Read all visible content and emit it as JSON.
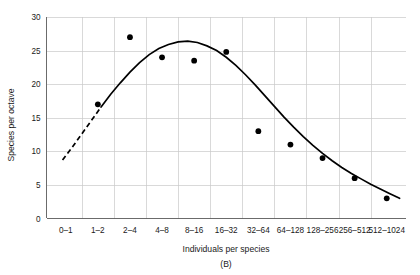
{
  "chart_data": {
    "type": "scatter",
    "title": "",
    "panel_label": "(B)",
    "xlabel": "Individuals per species",
    "ylabel": "Species per octave",
    "categories": [
      "0–1",
      "1–2",
      "2–4",
      "4–8",
      "8–16",
      "16–32",
      "32–64",
      "64–128",
      "128–256",
      "256–512",
      "512–1024"
    ],
    "values": [
      null,
      17,
      27,
      24,
      23.5,
      24.8,
      13,
      11,
      9,
      6,
      3
    ],
    "points": [
      {
        "category": "1–2",
        "x_index": 1,
        "y": 17
      },
      {
        "category": "2–4",
        "x_index": 2,
        "y": 27
      },
      {
        "category": "4–8",
        "x_index": 3,
        "y": 24
      },
      {
        "category": "8–16",
        "x_index": 4,
        "y": 23.5
      },
      {
        "category": "16–32",
        "x_index": 5,
        "y": 24.8
      },
      {
        "category": "32–64",
        "x_index": 6,
        "y": 13
      },
      {
        "category": "64–128",
        "x_index": 7,
        "y": 11
      },
      {
        "category": "128–256",
        "x_index": 8,
        "y": 9
      },
      {
        "category": "256–512",
        "x_index": 9,
        "y": 6
      },
      {
        "category": "512–1024",
        "x_index": 10,
        "y": 3
      }
    ],
    "fitted_curve": {
      "name": "lognormal fit",
      "style": "solid",
      "dashed_segment": "left extrapolation below veil line",
      "x_index": [
        -0.1,
        0.2,
        0.5,
        0.8,
        1.1,
        1.4,
        1.7,
        2.0,
        2.3,
        2.6,
        2.9,
        3.2,
        3.5,
        3.8,
        4.1,
        4.4,
        4.7,
        5.0,
        5.3,
        5.6,
        5.9,
        6.2,
        6.5,
        6.8,
        7.1,
        7.4,
        7.7,
        8.0,
        8.3,
        8.6,
        8.9,
        9.2,
        9.5,
        9.8,
        10.1,
        10.4
      ],
      "y": [
        8.7,
        10.6,
        12.6,
        14.6,
        16.6,
        18.5,
        20.2,
        21.8,
        23.2,
        24.4,
        25.3,
        25.9,
        26.3,
        26.4,
        26.2,
        25.7,
        25.0,
        24.0,
        22.8,
        21.4,
        19.9,
        18.3,
        16.7,
        15.1,
        13.6,
        12.2,
        10.9,
        9.7,
        8.6,
        7.6,
        6.7,
        5.9,
        5.1,
        4.4,
        3.7,
        3.0
      ],
      "dash_until_x_index": 0.95
    },
    "ytick_labels": [
      "0",
      "5",
      "10",
      "15",
      "20",
      "25",
      "30"
    ],
    "ytick_values": [
      0,
      5,
      10,
      15,
      20,
      25,
      30
    ],
    "ylim": [
      0,
      30
    ],
    "xlim_index": [
      -0.6,
      10.6
    ],
    "grid": "both",
    "legend": "none",
    "colors": {
      "point": "#000000",
      "curve": "#000000",
      "grid": "#c9c9c9",
      "axis": "#5b5b5b",
      "text": "#1a1a1a",
      "background": "#ffffff"
    }
  }
}
